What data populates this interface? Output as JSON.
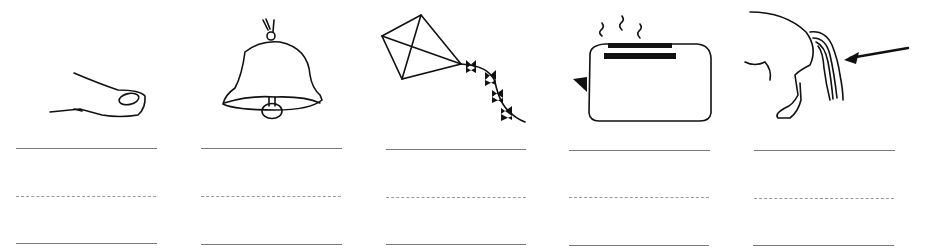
{
  "worksheet": {
    "type": "handwriting practice",
    "items": [
      {
        "subject": "thumb",
        "icon": "thumb-icon"
      },
      {
        "subject": "bell",
        "icon": "bell-icon"
      },
      {
        "subject": "kite",
        "icon": "kite-icon"
      },
      {
        "subject": "toaster",
        "icon": "toaster-icon"
      },
      {
        "subject": "tail",
        "icon": "horse-tail-icon"
      }
    ],
    "writing_lines": [
      "solid",
      "dotted",
      "solid"
    ]
  }
}
